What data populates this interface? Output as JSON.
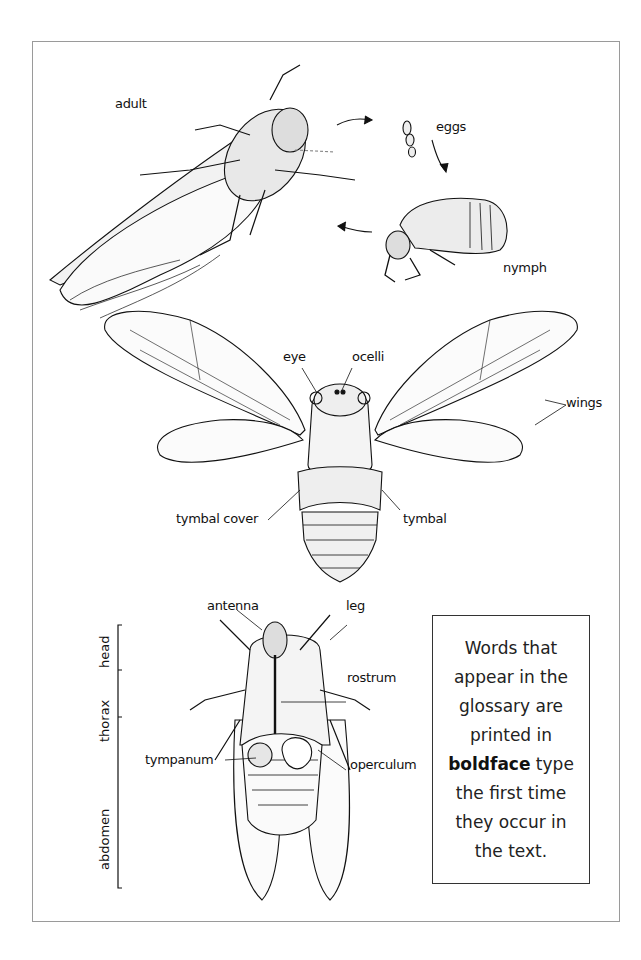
{
  "life_cycle": {
    "labels": {
      "adult": "adult",
      "eggs": "eggs",
      "nymph": "nymph"
    }
  },
  "dorsal_view": {
    "labels": {
      "eye": "eye",
      "ocelli": "ocelli",
      "wings": "wings",
      "tymbal_cover": "tymbal cover",
      "tymbal": "tymbal"
    }
  },
  "ventral_view": {
    "labels": {
      "antenna": "antenna",
      "leg": "leg",
      "rostrum": "rostrum",
      "tympanum": "tympanum",
      "operculum": "operculum"
    },
    "body_regions": {
      "head": "head",
      "thorax": "thorax",
      "abdomen": "abdomen"
    }
  },
  "glossary_note": {
    "lines": [
      "Words that",
      "appear in the",
      "glossary are",
      "printed in",
      "the first time",
      "they occur in",
      "the text."
    ],
    "bold_word": "boldface",
    "after_bold": " type"
  }
}
